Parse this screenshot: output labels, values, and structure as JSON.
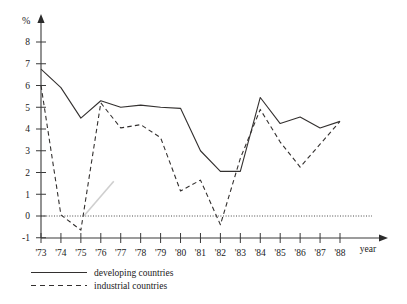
{
  "chart_data": {
    "type": "line",
    "title": "",
    "xlabel": "year",
    "ylabel": "%",
    "grid": false,
    "legend_position": "bottom-left",
    "xlim": [
      1973,
      1988
    ],
    "ylim": [
      -1,
      8.6
    ],
    "x": [
      1973,
      1974,
      1975,
      1976,
      1977,
      1978,
      1979,
      1980,
      1981,
      1982,
      1983,
      1984,
      1985,
      1986,
      1987,
      1988
    ],
    "categories": [
      "'73",
      "'74",
      "'75",
      "'76",
      "'77",
      "'78",
      "'79",
      "'80",
      "'81",
      "'82",
      "'83",
      "'84",
      "'85",
      "'86",
      "'87",
      "'88"
    ],
    "ytick_labels": [
      "-1",
      "0",
      "1",
      "2",
      "3",
      "4",
      "5",
      "6",
      "7",
      "8"
    ],
    "ytick_values": [
      -1,
      0,
      1,
      2,
      3,
      4,
      5,
      6,
      7,
      8
    ],
    "zero_line": 0,
    "series": [
      {
        "name": "developing countries",
        "style": "solid",
        "color": "#33302f",
        "values": [
          6.75,
          5.9,
          4.5,
          5.3,
          5.0,
          5.1,
          5.0,
          4.95,
          3.0,
          2.05,
          2.05,
          5.45,
          4.25,
          4.55,
          4.05,
          4.35
        ]
      },
      {
        "name": "industrial countries",
        "style": "dashed",
        "color": "#33302f",
        "values": [
          6.0,
          0.05,
          -0.65,
          5.2,
          4.05,
          4.2,
          3.6,
          1.15,
          1.65,
          -0.4,
          2.65,
          4.9,
          3.4,
          2.25,
          3.3,
          4.35
        ]
      }
    ],
    "annotations": [
      {
        "name": "faint-artifact-line",
        "type": "segment",
        "from": {
          "x": 1975.15,
          "y": 0.0
        },
        "to": {
          "x": 1976.65,
          "y": 1.6
        },
        "color": "#cfcfcf"
      }
    ]
  },
  "legend": {
    "items": [
      {
        "label": "developing countries",
        "style": "solid"
      },
      {
        "label": "industrial countries",
        "style": "dashed"
      }
    ]
  },
  "axes": {
    "y_unit_label": "%",
    "x_unit_label": "year"
  }
}
